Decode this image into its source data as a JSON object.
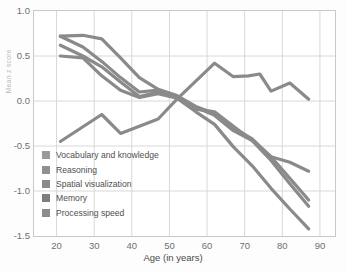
{
  "chart_data": {
    "type": "line",
    "title": "",
    "xlabel": "Age (in years)",
    "ylabel": "Mean z score",
    "xlim": [
      14,
      94
    ],
    "ylim": [
      -1.5,
      1.0
    ],
    "xticks": [
      20,
      30,
      40,
      50,
      60,
      70,
      80,
      90
    ],
    "yticks": [
      -1.5,
      -1.0,
      -0.5,
      0.0,
      0.5,
      1.0
    ],
    "ytick_labels": [
      "-1.5",
      "-1.0",
      "-0.5",
      "0.0",
      "0.5",
      "1.0"
    ],
    "xtick_labels": [
      "20",
      "30",
      "40",
      "50",
      "60",
      "70",
      "80",
      "90"
    ],
    "grid": true,
    "legend_position": "lower-left-inside",
    "line_color": "#8a8a8a",
    "line_width": 3.2,
    "series": [
      {
        "name": "Vocabulary and knowledge",
        "swatch": "#9a9a9a",
        "x": [
          21,
          32,
          37,
          42,
          47,
          52,
          57,
          62,
          67,
          71,
          74,
          77,
          82,
          87
        ],
        "y": [
          -0.45,
          -0.15,
          -0.36,
          -0.28,
          -0.2,
          0.02,
          0.22,
          0.42,
          0.27,
          0.28,
          0.3,
          0.11,
          0.2,
          0.02
        ]
      },
      {
        "name": "Reasoning",
        "swatch": "#8f8f8f",
        "x": [
          21,
          27,
          32,
          37,
          42,
          47,
          52,
          57,
          62,
          67,
          72,
          77,
          82,
          87
        ],
        "y": [
          0.72,
          0.73,
          0.69,
          0.48,
          0.26,
          0.13,
          0.06,
          -0.06,
          -0.14,
          -0.3,
          -0.42,
          -0.62,
          -0.86,
          -1.1
        ]
      },
      {
        "name": "Spatial visualization",
        "swatch": "#8a8a8a",
        "x": [
          21,
          27,
          32,
          37,
          42,
          47,
          52,
          57,
          62,
          67,
          72,
          77,
          82,
          87
        ],
        "y": [
          0.72,
          0.6,
          0.44,
          0.26,
          0.1,
          0.12,
          0.05,
          -0.07,
          -0.16,
          -0.33,
          -0.44,
          -0.62,
          -0.68,
          -0.78
        ]
      },
      {
        "name": "Memory",
        "swatch": "#7e7e7e",
        "x": [
          21,
          27,
          32,
          37,
          42,
          47,
          52,
          57,
          62,
          67,
          72,
          77,
          82,
          87
        ],
        "y": [
          0.62,
          0.5,
          0.38,
          0.21,
          0.05,
          0.1,
          0.04,
          -0.09,
          -0.12,
          -0.28,
          -0.44,
          -0.66,
          -0.92,
          -1.17
        ]
      },
      {
        "name": "Processing speed",
        "swatch": "#8d8d8d",
        "x": [
          21,
          27,
          32,
          37,
          42,
          47,
          52,
          57,
          62,
          67,
          72,
          77,
          82,
          87
        ],
        "y": [
          0.5,
          0.48,
          0.28,
          0.12,
          0.04,
          0.08,
          0.03,
          -0.12,
          -0.26,
          -0.51,
          -0.72,
          -0.97,
          -1.2,
          -1.42
        ]
      }
    ]
  }
}
